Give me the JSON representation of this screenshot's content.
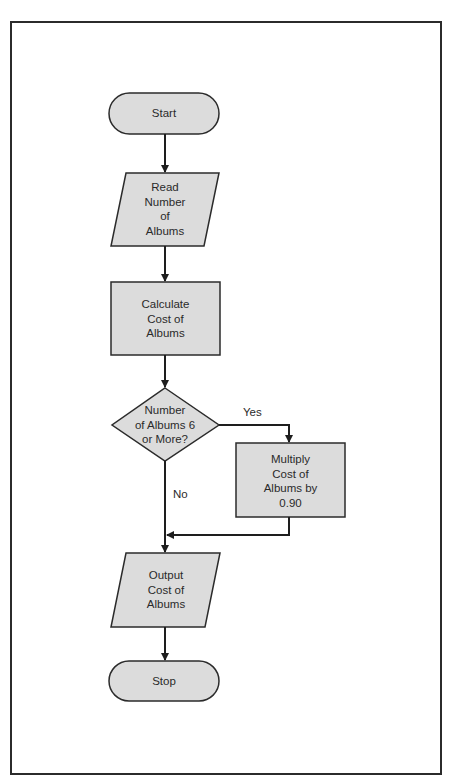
{
  "diagram": {
    "type": "flowchart",
    "colors": {
      "shape_fill": "#dcdcdc",
      "stroke": "#2b2b2b",
      "text": "#2a2a2a",
      "background": "#ffffff"
    },
    "nodes": [
      {
        "id": "start",
        "shape": "terminal",
        "label": "Start"
      },
      {
        "id": "read",
        "shape": "parallelogram",
        "label": "Read\nNumber\nof\nAlbums"
      },
      {
        "id": "calc",
        "shape": "rectangle",
        "label": "Calculate\nCost of\nAlbums"
      },
      {
        "id": "decision",
        "shape": "diamond",
        "label": "Number\nof Albums 6\nor More?"
      },
      {
        "id": "multiply",
        "shape": "rectangle",
        "label": "Multiply\nCost of\nAlbums by\n0.90"
      },
      {
        "id": "output",
        "shape": "parallelogram",
        "label": "Output\nCost of\nAlbums"
      },
      {
        "id": "stop",
        "shape": "terminal",
        "label": "Stop"
      }
    ],
    "edges": [
      {
        "from": "start",
        "to": "read",
        "label": ""
      },
      {
        "from": "read",
        "to": "calc",
        "label": ""
      },
      {
        "from": "calc",
        "to": "decision",
        "label": ""
      },
      {
        "from": "decision",
        "to": "multiply",
        "label": "Yes"
      },
      {
        "from": "decision",
        "to": "output",
        "label": "No"
      },
      {
        "from": "multiply",
        "to": "output",
        "label": ""
      },
      {
        "from": "output",
        "to": "stop",
        "label": ""
      }
    ],
    "edge_labels": {
      "yes": "Yes",
      "no": "No"
    }
  }
}
